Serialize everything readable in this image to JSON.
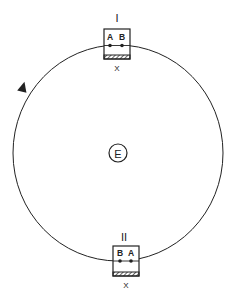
{
  "diagram": {
    "center_label": "E",
    "top_station": {
      "label": "I",
      "left_point": "A",
      "right_point": "B",
      "base_label": "X"
    },
    "bottom_station": {
      "label": "II",
      "left_point": "B",
      "right_point": "A",
      "base_label": "X"
    },
    "direction": "counterclockwise",
    "colors": {
      "stroke": "#222222",
      "background": "#ffffff"
    }
  }
}
